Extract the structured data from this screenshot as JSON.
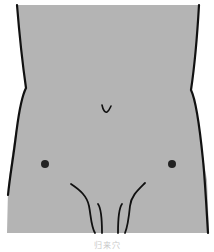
{
  "figure": {
    "fill_color": "#b4b4b4",
    "outline_color": "#111111",
    "markers": [
      {
        "name": "left-acupoint",
        "cx": 45,
        "cy": 164,
        "r": 4
      },
      {
        "name": "right-acupoint",
        "cx": 172,
        "cy": 164,
        "r": 4
      }
    ],
    "navel": {
      "x": 106,
      "y": 109
    }
  },
  "caption": {
    "text": "归来穴",
    "color": "#c8c8c8"
  }
}
